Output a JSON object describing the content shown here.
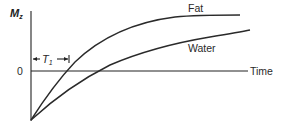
{
  "diagram": {
    "y_axis": {
      "label_main": "M",
      "label_sub": "z",
      "zero_label": "0"
    },
    "x_axis": {
      "label": "Time"
    },
    "interval": {
      "label_main": "T",
      "label_sub": "1"
    },
    "curves": [
      {
        "name": "Fat",
        "label": "Fat"
      },
      {
        "name": "Water",
        "label": "Water"
      }
    ],
    "colors": {
      "line": "#2a2a2a",
      "background": "#ffffff"
    }
  }
}
